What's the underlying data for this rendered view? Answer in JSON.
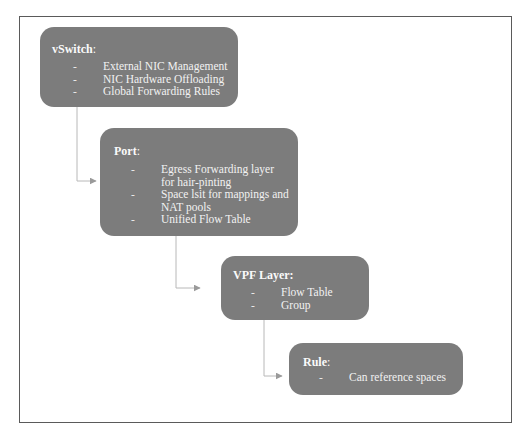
{
  "diagram": {
    "colors": {
      "box_fill": "#7c7c7c",
      "box_text": "#f2f2f2",
      "connector": "#b0b0b0",
      "frame": "#5a5a5a"
    },
    "nodes": [
      {
        "id": "vswitch",
        "title": "vSwitch",
        "title_suffix": ":",
        "items": [
          "External NIC Management",
          "NIC Hardware Offloading",
          "Global Forwarding Rules"
        ]
      },
      {
        "id": "port",
        "title": "Port",
        "title_suffix": ":",
        "items": [
          "Egress Forwarding layer for hair-pinting",
          "Space lsit for mappings and NAT pools",
          "Unified Flow Table"
        ]
      },
      {
        "id": "vpf-layer",
        "title": "VPF Layer",
        "title_suffix": ":",
        "items": [
          "Flow Table",
          "Group"
        ]
      },
      {
        "id": "rule",
        "title": "Rule",
        "title_suffix": ":",
        "items": [
          "Can reference spaces"
        ]
      }
    ],
    "bullet": "-",
    "edges": [
      {
        "from": "vswitch",
        "to": "port"
      },
      {
        "from": "port",
        "to": "vpf-layer"
      },
      {
        "from": "vpf-layer",
        "to": "rule"
      }
    ]
  }
}
